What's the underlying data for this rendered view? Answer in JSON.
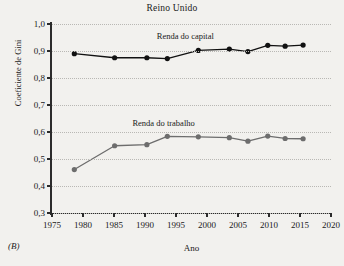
{
  "chart_data": {
    "type": "line",
    "title": "Reino Unido",
    "panel_tag": "(B)",
    "xlabel": "Ano",
    "ylabel": "Coeficiente de Gini",
    "xlim": [
      1975,
      2020
    ],
    "ylim": [
      0.3,
      1.0
    ],
    "grid": true,
    "legend_position": "inline-annotation",
    "xticks": [
      1975,
      1980,
      1985,
      1990,
      1995,
      2000,
      2005,
      2010,
      2015,
      2020
    ],
    "xtick_labels": [
      "1975",
      "1980",
      "1985",
      "1990",
      "1995",
      "2000",
      "2005",
      "2010",
      "2015",
      "2020"
    ],
    "yticks": [
      0.3,
      0.4,
      0.5,
      0.6,
      0.7,
      0.8,
      0.9,
      1.0
    ],
    "ytick_labels": [
      "0,3",
      "0,4",
      "0,5",
      "0,6",
      "0,7",
      "0,8",
      "0,9",
      "1,0"
    ],
    "series": [
      {
        "name": "Renda do capital",
        "color": "#111111",
        "label_x": 1996.5,
        "label_y": 0.955,
        "points": [
          {
            "x": 1978.6,
            "y": 0.89
          },
          {
            "x": 1985.1,
            "y": 0.875
          },
          {
            "x": 1990.3,
            "y": 0.875
          },
          {
            "x": 1993.6,
            "y": 0.872
          },
          {
            "x": 1998.6,
            "y": 0.902
          },
          {
            "x": 2003.6,
            "y": 0.907
          },
          {
            "x": 2006.6,
            "y": 0.898
          },
          {
            "x": 2009.8,
            "y": 0.921
          },
          {
            "x": 2012.6,
            "y": 0.918
          },
          {
            "x": 2015.5,
            "y": 0.922
          }
        ]
      },
      {
        "name": "Renda do trabalho",
        "color": "#6d6d6d",
        "label_x": 1993.0,
        "label_y": 0.632,
        "points": [
          {
            "x": 1978.6,
            "y": 0.461
          },
          {
            "x": 1985.1,
            "y": 0.549
          },
          {
            "x": 1990.3,
            "y": 0.553
          },
          {
            "x": 1993.6,
            "y": 0.584
          },
          {
            "x": 1998.6,
            "y": 0.582
          },
          {
            "x": 2003.6,
            "y": 0.579
          },
          {
            "x": 2006.6,
            "y": 0.566
          },
          {
            "x": 2009.8,
            "y": 0.585
          },
          {
            "x": 2012.6,
            "y": 0.576
          },
          {
            "x": 2015.5,
            "y": 0.575
          }
        ]
      }
    ]
  }
}
